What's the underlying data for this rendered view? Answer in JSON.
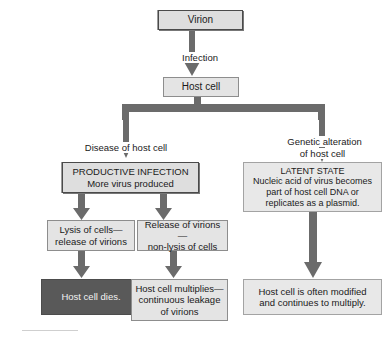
{
  "diagram": {
    "colors": {
      "arrow_fill": "#6b6b6b",
      "box_fill": "#dedede",
      "box_fill_pale": "#e8e8e8",
      "box_fill_dark": "#595959",
      "box_border": "#6e6e6e",
      "text": "#1a1a1a",
      "text_on_dark": "#f2f2f2",
      "background": "#ffffff"
    },
    "nodes": {
      "virion": "Virion",
      "host_cell": "Host cell",
      "productive_infection": "PRODUCTIVE INFECTION\nMore virus produced",
      "latent_state": "LATENT STATE\nNucleic acid of virus becomes\npart of host cell DNA or\nreplicates as a plasmid.",
      "lysis_of_cells": "Lysis of cells—\nrelease of virions",
      "release_of_virions": "Release of virions—\nnon-lysis of cells",
      "host_cell_dies": "Host cell dies.",
      "host_cell_multiplies": "Host cell multiplies—\ncontinuous leakage\nof virions",
      "host_cell_modified": "Host cell is often modified\nand continues to multiply."
    },
    "edge_labels": {
      "infection": "Infection",
      "disease_of_host_cell": "Disease of host cell",
      "genetic_alteration": "Genetic alteration\nof host cell"
    }
  }
}
